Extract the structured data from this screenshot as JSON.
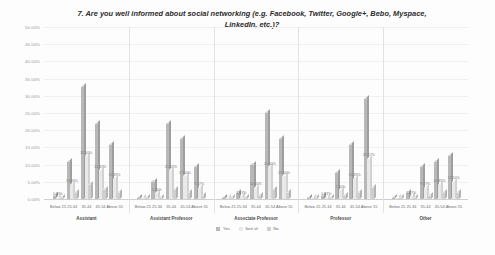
{
  "chart_data": {
    "type": "bar",
    "title": "7. Are you well informed about social networking (e.g. Facebook, Twitter, Google+, Bebo, Myspace, LinkedIn, etc.)?",
    "xlabel": "",
    "ylabel": "",
    "ylim": [
      0,
      50
    ],
    "ytick_labels": [
      "50.00%",
      "45.00%",
      "40.00%",
      "35.00%",
      "30.00%",
      "25.00%",
      "20.00%",
      "15.00%",
      "10.00%",
      "5.00%",
      "0.00%"
    ],
    "ytick_values": [
      50,
      45,
      40,
      35,
      30,
      25,
      20,
      15,
      10,
      5,
      0
    ],
    "grid": true,
    "legend_position": "bottom",
    "legend": [
      "Yes",
      "Sort of",
      "No"
    ],
    "groups": [
      "Assistant",
      "Assistant Professor",
      "Associate Professor",
      "Professor",
      "Other"
    ],
    "categories": [
      "Below 25",
      "25-34",
      "35-44",
      "45-54",
      "Above 55"
    ],
    "series": [
      {
        "name": "Yes",
        "values": [
          [
            0.83,
            10.83,
            32.5,
            21.67,
            15.83
          ],
          [
            0.0,
            5.0,
            21.67,
            17.5,
            9.17
          ],
          [
            0.0,
            1.67,
            10.0,
            25.0,
            17.5
          ],
          [
            0.0,
            0.83,
            7.5,
            15.83,
            29.17
          ],
          [
            0.0,
            1.67,
            9.17,
            10.83,
            12.5
          ]
        ]
      },
      {
        "name": "Sort of",
        "values": [
          [
            0.42,
            4.17,
            12.5,
            8.33,
            5.83
          ],
          [
            0.0,
            1.67,
            8.33,
            6.67,
            3.33
          ],
          [
            0.0,
            0.83,
            3.33,
            9.17,
            6.67
          ],
          [
            0.0,
            0.42,
            2.5,
            5.83,
            11.67
          ],
          [
            0.0,
            0.83,
            3.33,
            4.17,
            5.0
          ]
        ]
      },
      {
        "name": "No",
        "values": [
          [
            0.0,
            1.67,
            4.17,
            2.5,
            1.67
          ],
          [
            0.0,
            0.42,
            2.5,
            1.67,
            0.83
          ],
          [
            0.0,
            0.0,
            0.83,
            2.5,
            1.67
          ],
          [
            0.0,
            0.0,
            0.83,
            1.67,
            3.33
          ],
          [
            0.0,
            0.42,
            0.83,
            1.67,
            1.67
          ]
        ]
      }
    ],
    "labels": {
      "g0": [
        "0.83%",
        "10.83%",
        "32.50%",
        "21.67%",
        "15.83%"
      ],
      "g1": [
        "",
        "5.00%",
        "21.67%",
        "17.50%",
        "9.17%"
      ],
      "g2": [
        "",
        "1.67%",
        "10.00%",
        "25.00%",
        "17.50%"
      ],
      "g3": [
        "",
        "0.83%",
        "7.50%",
        "15.83%",
        "29.17%"
      ],
      "g4": [
        "",
        "1.67%",
        "9.17%",
        "10.83%",
        "12.50%"
      ]
    }
  }
}
